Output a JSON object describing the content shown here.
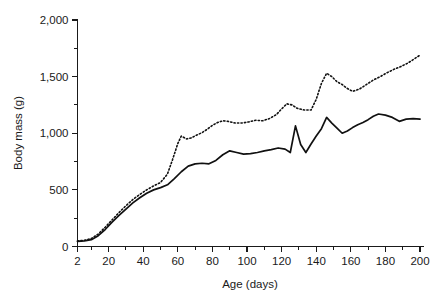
{
  "chart_data": {
    "type": "line",
    "title": "",
    "subtitle": "",
    "xlabel": "Age (days)",
    "ylabel": "Body mass (g)",
    "xlim": [
      2,
      202
    ],
    "ylim": [
      0,
      2000
    ],
    "grid": false,
    "legend": "none",
    "x_ticks": [
      2,
      20,
      40,
      60,
      80,
      100,
      120,
      140,
      160,
      180,
      200
    ],
    "x_tick_labels": [
      "2",
      "20",
      "40",
      "60",
      "80",
      "100",
      "120",
      "140",
      "160",
      "180",
      "200"
    ],
    "x_minor_ticks": [
      10,
      30,
      50,
      70,
      90,
      110,
      130,
      150,
      170,
      190
    ],
    "y_ticks": [
      0,
      500,
      1000,
      1500,
      2000
    ],
    "y_tick_labels": [
      "0",
      "500",
      "1,000",
      "1,500",
      "2,000"
    ],
    "y_minor_ticks": [
      250,
      750,
      1250,
      1750
    ],
    "series": [
      {
        "name": "solid-line",
        "style": "solid",
        "color": "#111111",
        "x": [
          2,
          6,
          10,
          14,
          18,
          22,
          26,
          30,
          34,
          38,
          42,
          46,
          50,
          54,
          58,
          62,
          66,
          70,
          74,
          78,
          82,
          86,
          90,
          94,
          98,
          102,
          106,
          110,
          114,
          118,
          122,
          125,
          128,
          131,
          134,
          137,
          140,
          143,
          146,
          149,
          152,
          155,
          158,
          161,
          164,
          167,
          170,
          173,
          176,
          180,
          184,
          188,
          192,
          196,
          200
        ],
        "values": [
          45,
          50,
          60,
          95,
          150,
          215,
          275,
          330,
          385,
          430,
          470,
          500,
          520,
          545,
          600,
          660,
          710,
          730,
          735,
          730,
          760,
          810,
          845,
          830,
          815,
          820,
          830,
          845,
          855,
          870,
          860,
          830,
          1065,
          900,
          830,
          905,
          975,
          1040,
          1140,
          1090,
          1045,
          1000,
          1020,
          1050,
          1075,
          1095,
          1120,
          1150,
          1170,
          1160,
          1140,
          1105,
          1125,
          1130,
          1125
        ]
      },
      {
        "name": "dotted-line",
        "style": "dotted",
        "color": "#111111",
        "x": [
          2,
          6,
          10,
          14,
          18,
          22,
          26,
          30,
          34,
          38,
          42,
          46,
          50,
          54,
          57,
          60,
          62,
          65,
          68,
          71,
          74,
          77,
          80,
          83,
          86,
          89,
          93,
          97,
          101,
          105,
          109,
          113,
          117,
          120,
          123,
          126,
          129,
          133,
          137,
          140,
          143,
          146,
          149,
          152,
          155,
          158,
          161,
          165,
          169,
          173,
          177,
          181,
          185,
          189,
          193,
          197,
          200
        ],
        "values": [
          48,
          55,
          70,
          110,
          170,
          235,
          300,
          360,
          415,
          460,
          500,
          535,
          565,
          640,
          770,
          910,
          975,
          950,
          960,
          985,
          1005,
          1035,
          1070,
          1095,
          1110,
          1105,
          1090,
          1090,
          1100,
          1115,
          1110,
          1130,
          1165,
          1215,
          1260,
          1250,
          1220,
          1205,
          1205,
          1300,
          1440,
          1530,
          1500,
          1455,
          1430,
          1395,
          1370,
          1390,
          1430,
          1470,
          1500,
          1535,
          1565,
          1590,
          1620,
          1660,
          1690
        ]
      }
    ]
  }
}
